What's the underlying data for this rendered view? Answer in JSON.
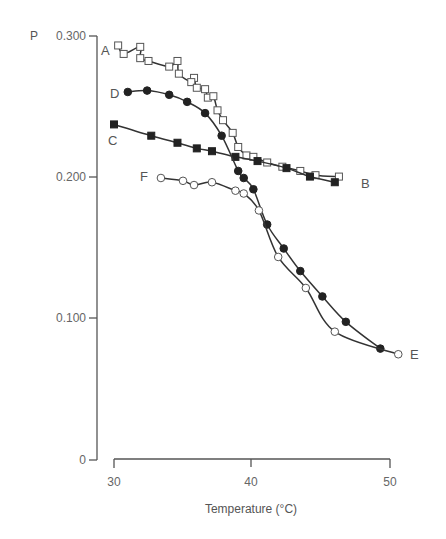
{
  "chart_data": {
    "type": "line",
    "title": "",
    "xlabel": "Temperature (°C)",
    "ylabel": "P",
    "xlim": [
      30,
      50
    ],
    "ylim": [
      0,
      0.3
    ],
    "xticks": [
      30,
      40,
      50
    ],
    "xtick_labels": [
      "30",
      "40",
      "50"
    ],
    "yticks": [
      0,
      0.1,
      0.2,
      0.3
    ],
    "ytick_labels": [
      "0",
      "0.100",
      "0.200",
      "0.300"
    ],
    "grid": false,
    "legend": "curve letters placed at line ends",
    "series": [
      {
        "name": "A→B (heating, open squares)",
        "marker": "open-square",
        "start_label": "A",
        "end_label": "B",
        "x": [
          30.3,
          30.7,
          31.9,
          31.9,
          32.5,
          34.0,
          34.6,
          34.7,
          35.8,
          35.6,
          36.0,
          36.6,
          36.8,
          37.2,
          37.5,
          37.9,
          38.6,
          39.0,
          39.6,
          40.1,
          41.1,
          42.2,
          43.5,
          44.6,
          46.3
        ],
        "y": [
          0.294,
          0.288,
          0.293,
          0.285,
          0.283,
          0.279,
          0.283,
          0.274,
          0.271,
          0.268,
          0.264,
          0.263,
          0.257,
          0.258,
          0.248,
          0.241,
          0.232,
          0.222,
          0.216,
          0.215,
          0.211,
          0.208,
          0.205,
          0.202,
          0.201
        ]
      },
      {
        "name": "C→B (cooling, filled squares)",
        "marker": "filled-square",
        "start_label": "C",
        "end_label": "B",
        "x": [
          30.0,
          32.7,
          34.6,
          36.0,
          37.1,
          38.8,
          40.4,
          42.5,
          44.2,
          46.0
        ],
        "y": [
          0.238,
          0.23,
          0.225,
          0.221,
          0.219,
          0.215,
          0.212,
          0.207,
          0.201,
          0.197
        ]
      },
      {
        "name": "D→E (filled circles)",
        "marker": "filled-circle",
        "start_label": "D",
        "end_label": "E",
        "x": [
          31.0,
          32.4,
          34.0,
          35.3,
          36.6,
          37.8,
          39.0,
          39.4,
          40.1,
          41.1,
          42.3,
          43.5,
          45.1,
          46.8,
          49.3
        ],
        "y": [
          0.261,
          0.262,
          0.259,
          0.254,
          0.246,
          0.23,
          0.205,
          0.2,
          0.192,
          0.167,
          0.15,
          0.134,
          0.116,
          0.098,
          0.079
        ]
      },
      {
        "name": "E→F (open circles)",
        "marker": "open-circle",
        "start_label": "E",
        "end_label": "F",
        "x": [
          50.6,
          46.0,
          43.9,
          41.9,
          40.5,
          39.4,
          38.8,
          37.1,
          35.8,
          35.0,
          33.4
        ],
        "y": [
          0.075,
          0.091,
          0.122,
          0.144,
          0.177,
          0.189,
          0.191,
          0.197,
          0.195,
          0.198,
          0.2
        ]
      }
    ],
    "annotations": [
      "A",
      "B",
      "C",
      "D",
      "E",
      "F"
    ]
  }
}
